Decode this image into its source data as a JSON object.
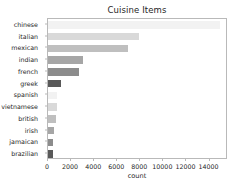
{
  "chart_data": {
    "type": "bar",
    "orientation": "horizontal",
    "title": "Cuisine Items",
    "xlabel": "count",
    "ylabel": "",
    "categories": [
      "chinese",
      "italian",
      "mexican",
      "indian",
      "french",
      "greek",
      "spanish",
      "vietnamese",
      "british",
      "irish",
      "jamaican",
      "brazilian"
    ],
    "values": [
      14900,
      7900,
      6900,
      3000,
      2700,
      1150,
      800,
      750,
      700,
      550,
      450,
      400
    ],
    "xlim": [
      0,
      15600
    ],
    "ylim_categories": 12,
    "xticks": [
      0,
      2000,
      4000,
      6000,
      8000,
      10000,
      12000,
      14000
    ],
    "xtick_labels": [
      "0",
      "2000",
      "4000",
      "6000",
      "8000",
      "10000",
      "12000",
      "14000"
    ],
    "grid": false,
    "legend": null,
    "bar_colors": [
      "#f2f2f2",
      "#d9d9d9",
      "#bfbfbf",
      "#a6a6a6",
      "#8c8c8c",
      "#595959",
      "#f2f2f2",
      "#d9d9d9",
      "#bfbfbf",
      "#a6a6a6",
      "#8c8c8c",
      "#595959"
    ],
    "frame_color": "#b9b9b9",
    "text_color": "#262626",
    "background": "#ffffff"
  }
}
